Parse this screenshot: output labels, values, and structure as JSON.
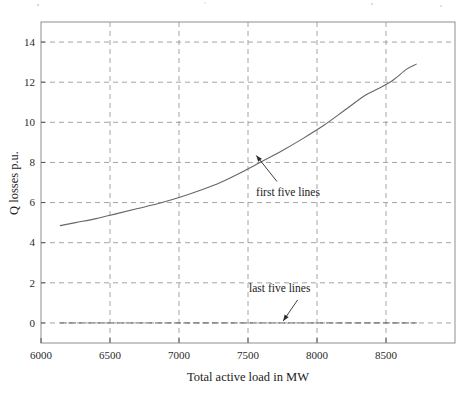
{
  "chart_data": {
    "type": "line",
    "title": "",
    "xlabel": "Total active load in MW",
    "ylabel": "Q losses p.u.",
    "xlim": [
      6000,
      9000
    ],
    "ylim": [
      -1,
      15
    ],
    "grid": true,
    "grid_style": "dashed",
    "legend": "none",
    "xticks": [
      6000,
      6500,
      7000,
      7500,
      8000,
      8500
    ],
    "xtick_labels": [
      "6000",
      "6500",
      "7000",
      "7500",
      "8000",
      "8500"
    ],
    "yticks": [
      0,
      2,
      4,
      6,
      8,
      10,
      12,
      14
    ],
    "ytick_labels": [
      "0",
      "2",
      "4",
      "6",
      "8",
      "10",
      "12",
      "14"
    ],
    "series": [
      {
        "name": "first five lines",
        "x": [
          6140,
          6250,
          6400,
          6550,
          6700,
          6850,
          7000,
          7150,
          7300,
          7450,
          7600,
          7750,
          7900,
          8050,
          8200,
          8350,
          8450,
          8550,
          8650,
          8720
        ],
        "y": [
          4.85,
          5.0,
          5.2,
          5.45,
          5.7,
          5.95,
          6.25,
          6.6,
          7.0,
          7.5,
          8.05,
          8.6,
          9.2,
          9.85,
          10.6,
          11.35,
          11.7,
          12.1,
          12.65,
          12.9
        ]
      },
      {
        "name": "last five lines",
        "x": [
          6140,
          6400,
          6700,
          7000,
          7300,
          7600,
          7900,
          8200,
          8500,
          8720
        ],
        "y": [
          0.0,
          0.0,
          0.0,
          0.0,
          0.0,
          0.0,
          0.0,
          0.0,
          0.0,
          0.0
        ]
      }
    ],
    "annotations": [
      {
        "text": "first five lines",
        "label_x": 7790,
        "label_y": 6.35,
        "arrow_tip_x": 7560,
        "arrow_tip_y": 8.35,
        "arrow_tail_x": 7710,
        "arrow_tail_y": 7.05
      },
      {
        "text": "last five lines",
        "label_x": 7730,
        "label_y": 1.55,
        "arrow_tip_x": 7755,
        "arrow_tip_y": 0.1,
        "arrow_tail_x": 7860,
        "arrow_tail_y": 1.15
      }
    ]
  }
}
